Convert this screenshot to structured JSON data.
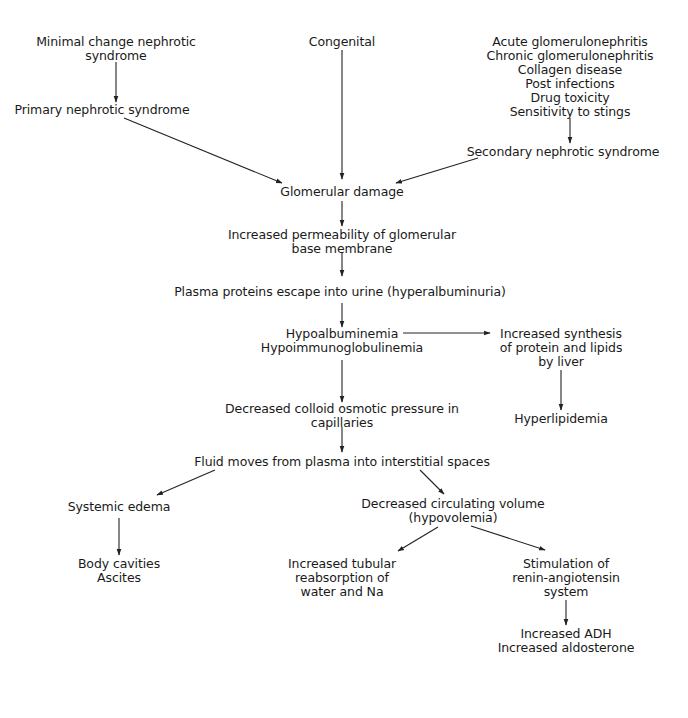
{
  "diagram": {
    "title": "",
    "nodes": {
      "minimal_change": {
        "lines": [
          "Minimal change nephrotic",
          "syndrome"
        ]
      },
      "congenital": {
        "lines": [
          "Congenital"
        ]
      },
      "secondary_causes": {
        "lines": [
          "Acute glomerulonephritis",
          "Chronic glomerulonephritis",
          "Collagen disease",
          "Post infections",
          "Drug toxicity",
          "Sensitivity to stings"
        ]
      },
      "primary": {
        "lines": [
          "Primary nephrotic syndrome"
        ]
      },
      "secondary": {
        "lines": [
          "Secondary nephrotic syndrome"
        ]
      },
      "glomerular_damage": {
        "lines": [
          "Glomerular damage"
        ]
      },
      "permeability": {
        "lines": [
          "Increased permeability of glomerular",
          "base membrane"
        ]
      },
      "plasma_proteins": {
        "lines": [
          "Plasma proteins escape into urine (hyperalbuminuria)"
        ]
      },
      "hypoalbuminemia": {
        "lines": [
          "Hypoalbuminemia",
          "Hypoimmunoglobulinemia"
        ]
      },
      "synthesis": {
        "lines": [
          "Increased synthesis",
          "of protein and lipids",
          "by liver"
        ]
      },
      "hyperlipidemia": {
        "lines": [
          "Hyperlipidemia"
        ]
      },
      "colloid_pressure": {
        "lines": [
          "Decreased colloid osmotic pressure in",
          "capillaries"
        ]
      },
      "fluid_moves": {
        "lines": [
          "Fluid moves from plasma into interstitial spaces"
        ]
      },
      "systemic_edema": {
        "lines": [
          "Systemic edema"
        ]
      },
      "hypovolemia": {
        "lines": [
          "Decreased circulating volume",
          "(hypovolemia)"
        ]
      },
      "body_cavities": {
        "lines": [
          "Body cavities",
          "Ascites"
        ]
      },
      "tubular": {
        "lines": [
          "Increased tubular",
          "reabsorption of",
          "water and Na"
        ]
      },
      "renin": {
        "lines": [
          "Stimulation of",
          "renin-angiotensin",
          "system"
        ]
      },
      "adh": {
        "lines": [
          "Increased ADH",
          "Increased aldosterone"
        ]
      }
    },
    "edges": [
      {
        "from": "minimal_change",
        "to": "primary"
      },
      {
        "from": "congenital",
        "to": "glomerular_damage"
      },
      {
        "from": "secondary_causes",
        "to": "secondary"
      },
      {
        "from": "primary",
        "to": "glomerular_damage"
      },
      {
        "from": "secondary",
        "to": "glomerular_damage"
      },
      {
        "from": "glomerular_damage",
        "to": "permeability"
      },
      {
        "from": "permeability",
        "to": "plasma_proteins"
      },
      {
        "from": "plasma_proteins",
        "to": "hypoalbuminemia"
      },
      {
        "from": "hypoalbuminemia",
        "to": "synthesis"
      },
      {
        "from": "synthesis",
        "to": "hyperlipidemia"
      },
      {
        "from": "hypoalbuminemia",
        "to": "colloid_pressure"
      },
      {
        "from": "colloid_pressure",
        "to": "fluid_moves"
      },
      {
        "from": "fluid_moves",
        "to": "systemic_edema"
      },
      {
        "from": "fluid_moves",
        "to": "hypovolemia"
      },
      {
        "from": "systemic_edema",
        "to": "body_cavities"
      },
      {
        "from": "hypovolemia",
        "to": "tubular"
      },
      {
        "from": "hypovolemia",
        "to": "renin"
      },
      {
        "from": "renin",
        "to": "adh"
      }
    ]
  }
}
